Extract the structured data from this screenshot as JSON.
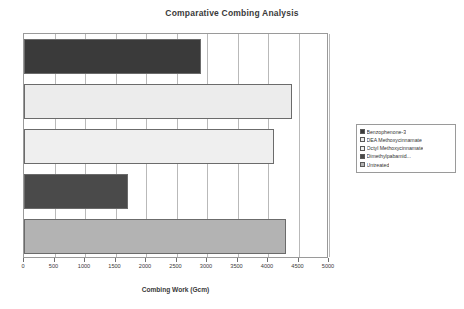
{
  "chart_data": {
    "type": "bar",
    "orientation": "horizontal",
    "title": "Comparative Combing Analysis",
    "xlabel": "Combing Work (Gcm)",
    "ylabel": "",
    "xlim": [
      0,
      5000
    ],
    "xticks": [
      0,
      500,
      1000,
      1500,
      2000,
      2500,
      3000,
      3500,
      4000,
      4500,
      5000
    ],
    "xtick_labels": [
      "0",
      "500",
      "1000",
      "1500",
      "2000",
      "2500",
      "3000",
      "3500",
      "4000",
      "4500",
      "5000"
    ],
    "grid": true,
    "legend_position": "right",
    "categories": [
      "Benzophenone-3",
      "DEA Methoxycinnamate",
      "Octyl Methoxycinnamate",
      "Dimethylpabamid...",
      "Untreated"
    ],
    "values": [
      2900,
      4400,
      4100,
      1700,
      4300
    ],
    "colors": [
      "#3a3a3a",
      "#ececec",
      "#efefef",
      "#4a4a4a",
      "#b3b3b3"
    ],
    "series": [
      {
        "name": "Combing Work",
        "values": [
          2900,
          4400,
          4100,
          1700,
          4300
        ]
      }
    ]
  },
  "legend": {
    "items": [
      {
        "label": "Benzophenone-3",
        "color": "#3a3a3a"
      },
      {
        "label": "DEA Methoxycinnamate",
        "color": "#ececec"
      },
      {
        "label": "Octyl Methoxycinnamate",
        "color": "#efefef"
      },
      {
        "label": "Dimethylpabamid...",
        "color": "#4a4a4a"
      },
      {
        "label": "Untreated",
        "color": "#b3b3b3"
      }
    ]
  }
}
